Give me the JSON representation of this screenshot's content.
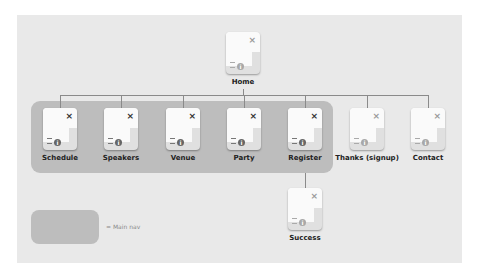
{
  "diagram": {
    "root": {
      "label": "Home"
    },
    "children": [
      {
        "label": "Schedule",
        "grouped": true
      },
      {
        "label": "Speakers",
        "grouped": true
      },
      {
        "label": "Venue",
        "grouped": true
      },
      {
        "label": "Party",
        "grouped": true
      },
      {
        "label": "Register",
        "grouped": true
      },
      {
        "label": "Thanks (signup)",
        "grouped": false
      },
      {
        "label": "Contact",
        "grouped": false
      }
    ],
    "register_child": {
      "label": "Success"
    }
  },
  "legend": {
    "text": "= Main nav"
  },
  "icons": {
    "close": "×",
    "info": "i"
  },
  "colors": {
    "panel": "#e9e9e9",
    "group": "#bdbdbd",
    "connector": "#8a8a8a"
  }
}
